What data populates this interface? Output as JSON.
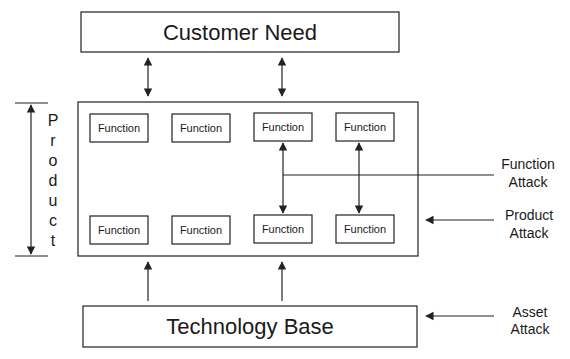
{
  "diagram": {
    "top_box": {
      "label": "Customer Need"
    },
    "bottom_box": {
      "label": "Technology Base"
    },
    "product_label": [
      "P",
      "r",
      "o",
      "d",
      "u",
      "c",
      "t"
    ],
    "functions_top": [
      "Function",
      "Function",
      "Function",
      "Function"
    ],
    "functions_bottom": [
      "Function",
      "Function",
      "Function",
      "Function"
    ],
    "attacks": {
      "function_attack": [
        "Function",
        "Attack"
      ],
      "product_attack": [
        "Product",
        "Attack"
      ],
      "asset_attack": [
        "Asset",
        "Attack"
      ]
    },
    "colors": {
      "stroke": "#222222",
      "background": "#ffffff",
      "text": "#1a1a1a"
    }
  }
}
